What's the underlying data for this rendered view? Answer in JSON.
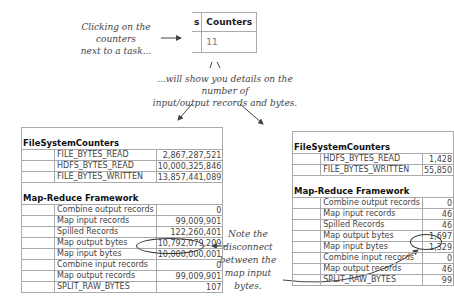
{
  "annotations": {
    "click_note": [
      "Clicking on the counters",
      "next to a task..."
    ],
    "details_note": [
      "...will show you details on the number of",
      "input/output records and bytes."
    ],
    "disconnect_note": [
      "Note the",
      "disconnect",
      "between the",
      "map input bytes."
    ]
  },
  "task_table": {
    "partial_header": "s",
    "header": "Counters",
    "value": "11"
  },
  "job_counters": {
    "groups": [
      {
        "title": "FileSystemCounters",
        "rows": [
          {
            "name": "FILE_BYTES_READ",
            "value": "2,867,287,521"
          },
          {
            "name": "HDFS_BYTES_READ",
            "value": "10,000,325,846"
          },
          {
            "name": "FILE_BYTES_WRITTEN",
            "value": "13,857,441,089"
          }
        ]
      },
      {
        "title": "Map-Reduce Framework",
        "rows": [
          {
            "name": "Combine output records",
            "value": "0"
          },
          {
            "name": "Map input records",
            "value": "99,009,901"
          },
          {
            "name": "Spilled Records",
            "value": "122,260,401"
          },
          {
            "name": "Map output bytes",
            "value": "10,792,079,209"
          },
          {
            "name": "Map input bytes",
            "value": "10,000,000,001"
          },
          {
            "name": "Combine input records",
            "value": "0"
          },
          {
            "name": "Map output records",
            "value": "99,009,901"
          },
          {
            "name": "SPLIT_RAW_BYTES",
            "value": "107"
          }
        ]
      }
    ]
  },
  "task_counters": {
    "groups": [
      {
        "title": "FileSystemCounters",
        "rows": [
          {
            "name": "HDFS_BYTES_READ",
            "value": "1,428"
          },
          {
            "name": "FILE_BYTES_WRITTEN",
            "value": "55,850"
          }
        ]
      },
      {
        "title": "Map-Reduce Framework",
        "rows": [
          {
            "name": "Combine output records",
            "value": "0"
          },
          {
            "name": "Map input records",
            "value": "46"
          },
          {
            "name": "Spilled Records",
            "value": "46"
          },
          {
            "name": "Map output bytes",
            "value": "1,697"
          },
          {
            "name": "Map input bytes",
            "value": "1,329"
          },
          {
            "name": "Combine input records",
            "value": "0"
          },
          {
            "name": "Map output records",
            "value": "46"
          },
          {
            "name": "SPLIT_RAW_BYTES",
            "value": "99"
          }
        ]
      }
    ]
  }
}
